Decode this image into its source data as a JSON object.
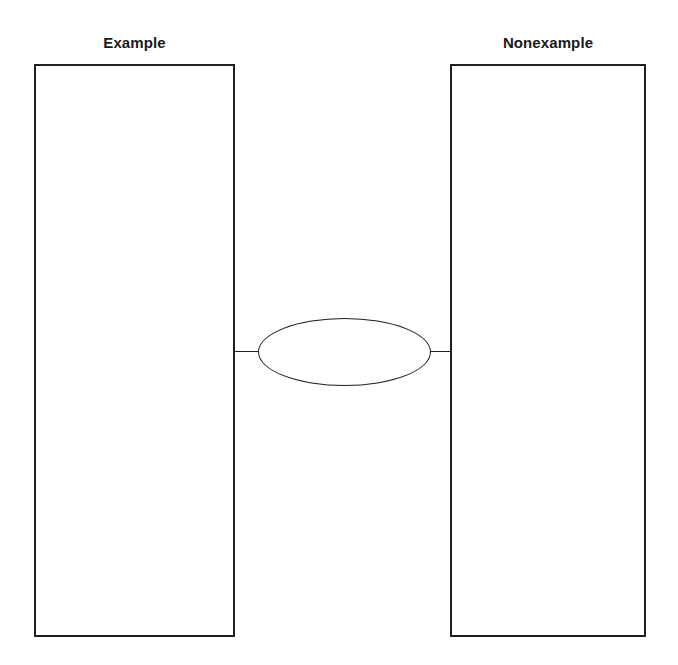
{
  "page": {
    "background_color": "#ffffff",
    "line_color": "#231f20"
  },
  "organizer": {
    "left_column": {
      "heading": "Example",
      "content": ""
    },
    "right_column": {
      "heading": "Nonexample",
      "content": ""
    },
    "center_node": {
      "shape": "ellipse",
      "content": ""
    },
    "connectors": [
      {
        "name": "left-spoke",
        "from": "center_node",
        "to": "left_column"
      },
      {
        "name": "right-spoke",
        "from": "center_node",
        "to": "right_column"
      }
    ]
  }
}
